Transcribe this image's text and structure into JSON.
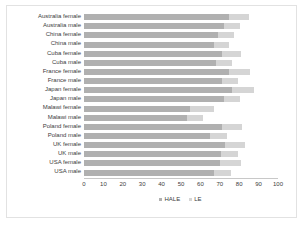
{
  "chart_data": {
    "type": "bar",
    "orientation": "horizontal",
    "stacked": true,
    "title": "",
    "subtitle": "",
    "xlabel": "",
    "ylabel": "",
    "xlim": [
      0,
      100
    ],
    "xticks": [
      0,
      10,
      20,
      30,
      40,
      50,
      60,
      70,
      80,
      90,
      100
    ],
    "xtick_labels": [
      "0",
      "10",
      "20",
      "30",
      "40",
      "50",
      "60",
      "70",
      "80",
      "90",
      "100"
    ],
    "grid": false,
    "legend_position": "bottom-center",
    "categories": [
      "Australia female",
      "Australia male",
      "China female",
      "China male",
      "Cuba female",
      "Cuba male",
      "France female",
      "France male",
      "Japan female",
      "Japan male",
      "Malawi female",
      "Malawi male",
      "Poland female",
      "Poland male",
      "UK female",
      "UK male",
      "USA female",
      "USA male"
    ],
    "series": [
      {
        "name": "HALE",
        "color": "#b0b0b0",
        "values": [
          74.5,
          72.0,
          69.0,
          67.0,
          71.0,
          68.0,
          74.5,
          71.0,
          76.5,
          72.0,
          54.5,
          53.0,
          71.0,
          65.0,
          72.5,
          70.5,
          70.0,
          67.0
        ]
      },
      {
        "name": "LE",
        "color": "#d5d5d5",
        "values": [
          85.0,
          80.5,
          77.5,
          74.5,
          81.0,
          76.5,
          85.5,
          79.5,
          87.5,
          80.5,
          67.0,
          61.5,
          81.5,
          73.5,
          83.0,
          79.5,
          81.0,
          76.0
        ]
      }
    ]
  },
  "legend": {
    "items": [
      {
        "label": "HALE",
        "color": "#b0b0b0"
      },
      {
        "label": "LE",
        "color": "#d5d5d5"
      }
    ]
  },
  "colors": {
    "hale": "#b0b0b0",
    "le": "#d5d5d5",
    "frame": "#e2e2e2",
    "axis": "#c8c8c8",
    "text": "#3d3d3d"
  }
}
